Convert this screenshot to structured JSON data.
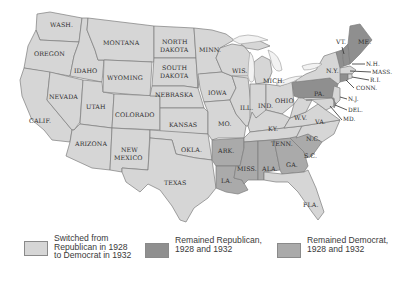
{
  "map": {
    "title": "",
    "colors": {
      "switched": "#d6d6d6",
      "remained_republican": "#8f8f8f",
      "remained_democrat": "#aaaaaa",
      "border": "#7d7d7d",
      "label": "#2e2e2e"
    },
    "states": [
      {
        "name": "WASH.",
        "category": "switched"
      },
      {
        "name": "OREGON",
        "category": "switched"
      },
      {
        "name": "CALIF.",
        "category": "switched"
      },
      {
        "name": "IDAHO",
        "category": "switched"
      },
      {
        "name": "NEVADA",
        "category": "switched"
      },
      {
        "name": "UTAH",
        "category": "switched"
      },
      {
        "name": "ARIZONA",
        "category": "switched"
      },
      {
        "name": "MONTANA",
        "category": "switched"
      },
      {
        "name": "WYOMING",
        "category": "switched"
      },
      {
        "name": "COLORADO",
        "category": "switched"
      },
      {
        "name": "NEW MEXICO",
        "category": "switched"
      },
      {
        "name": "NORTH DAKOTA",
        "category": "switched"
      },
      {
        "name": "SOUTH DAKOTA",
        "category": "switched"
      },
      {
        "name": "NEBRASKA",
        "category": "switched"
      },
      {
        "name": "KANSAS",
        "category": "switched"
      },
      {
        "name": "OKLA.",
        "category": "switched"
      },
      {
        "name": "TEXAS",
        "category": "switched"
      },
      {
        "name": "MINN.",
        "category": "switched"
      },
      {
        "name": "IOWA",
        "category": "switched"
      },
      {
        "name": "MO.",
        "category": "switched"
      },
      {
        "name": "ARK.",
        "category": "remained_democrat"
      },
      {
        "name": "LA.",
        "category": "remained_democrat"
      },
      {
        "name": "WIS.",
        "category": "switched"
      },
      {
        "name": "ILL.",
        "category": "switched"
      },
      {
        "name": "MICH.",
        "category": "switched"
      },
      {
        "name": "IND.",
        "category": "switched"
      },
      {
        "name": "OHIO",
        "category": "switched"
      },
      {
        "name": "KY.",
        "category": "switched"
      },
      {
        "name": "TENN.",
        "category": "switched"
      },
      {
        "name": "MISS.",
        "category": "remained_democrat"
      },
      {
        "name": "ALA.",
        "category": "remained_democrat"
      },
      {
        "name": "GA.",
        "category": "remained_democrat"
      },
      {
        "name": "S.C.",
        "category": "remained_democrat"
      },
      {
        "name": "N.C.",
        "category": "switched"
      },
      {
        "name": "FLA.",
        "category": "switched"
      },
      {
        "name": "VA.",
        "category": "switched"
      },
      {
        "name": "W.V.",
        "category": "switched"
      },
      {
        "name": "PA.",
        "category": "remained_republican"
      },
      {
        "name": "N.Y.",
        "category": "switched"
      },
      {
        "name": "VT.",
        "category": "remained_republican"
      },
      {
        "name": "ME.",
        "category": "remained_republican"
      },
      {
        "name": "N.H.",
        "category": "remained_republican"
      },
      {
        "name": "MASS.",
        "category": "switched"
      },
      {
        "name": "R.I.",
        "category": "switched"
      },
      {
        "name": "CONN.",
        "category": "remained_republican"
      },
      {
        "name": "N.J.",
        "category": "switched"
      },
      {
        "name": "DEL.",
        "category": "remained_republican"
      },
      {
        "name": "MD.",
        "category": "switched"
      }
    ],
    "labels": {
      "wash": "WASH.",
      "oregon": "OREGON",
      "calif": "CALIF.",
      "idaho": "IDAHO",
      "nevada": "NEVADA",
      "utah": "UTAH",
      "arizona": "ARIZONA",
      "montana": "MONTANA",
      "wyoming": "WYOMING",
      "colorado": "COLORADO",
      "new1": "NEW",
      "mexico": "MEXICO",
      "north": "NORTH",
      "dakota1": "DAKOTA",
      "south": "SOUTH",
      "dakota2": "DAKOTA",
      "nebraska": "NEBRASKA",
      "kansas": "KANSAS",
      "okla": "OKLA.",
      "texas": "TEXAS",
      "minn": "MINN.",
      "iowa": "IOWA",
      "mo": "MO.",
      "ark": "ARK.",
      "la": "LA.",
      "wis": "WIS.",
      "ill": "ILL.",
      "mich": "MICH.",
      "ind": "IND.",
      "ohio": "OHIO",
      "ky": "KY.",
      "tenn": "TENN.",
      "miss": "MISS.",
      "ala": "ALA.",
      "ga": "GA.",
      "sc": "S.C.",
      "nc": "N.C.",
      "fla": "FLA.",
      "va": "VA.",
      "wv": "W.V.",
      "pa": "PA.",
      "ny": "N.Y.",
      "vt": "VT.",
      "me": "ME.",
      "nh": "N.H.",
      "mass": "MASS.",
      "ri": "R.I.",
      "conn": "CONN.",
      "nj": "N.J.",
      "del": "DEL.",
      "md": "MD."
    }
  },
  "legend": {
    "items": [
      {
        "label": "Switched from\nRepublican in 1928\nto Democrat in 1932",
        "color": "#d6d6d6"
      },
      {
        "label": "Remained Republican,\n1928 and 1932",
        "color": "#8f8f8f"
      },
      {
        "label": "Remained Democrat,\n1928 and 1932",
        "color": "#aaaaaa"
      }
    ]
  }
}
